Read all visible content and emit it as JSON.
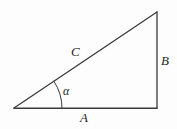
{
  "figure": {
    "kind": "right-triangle-diagram",
    "background_color": "#fdfdfd",
    "stroke_color": "#3a3a3a",
    "label_color": "#262626",
    "stroke_width": 1.3,
    "vertices": {
      "left": {
        "x": 14,
        "y": 108
      },
      "bottom_right": {
        "x": 157,
        "y": 108
      },
      "apex": {
        "x": 157,
        "y": 12
      }
    },
    "sides": [
      {
        "name": "base",
        "label": "A",
        "from": "left",
        "to": "bottom_right"
      },
      {
        "name": "vertical",
        "label": "B",
        "from": "bottom_right",
        "to": "apex"
      },
      {
        "name": "hypotenuse",
        "label": "C",
        "from": "left",
        "to": "apex"
      }
    ],
    "angle": {
      "label": "α",
      "at_vertex": "left",
      "arc_radius": 48,
      "degrees": 34
    },
    "labels": {
      "base": "A",
      "vertical": "B",
      "hypotenuse": "C",
      "angle": "α"
    }
  }
}
